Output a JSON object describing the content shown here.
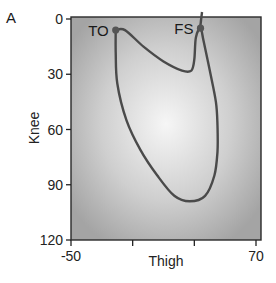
{
  "panel_label": "A",
  "chart_data": {
    "type": "line",
    "title": "",
    "xlabel": "Thigh",
    "ylabel": "Knee",
    "xlim": [
      -50,
      70
    ],
    "ylim": [
      120,
      0
    ],
    "y_inverted": true,
    "x_ticks": [
      -50,
      -10,
      30,
      70
    ],
    "x_tick_labels": [
      "-50",
      "",
      "",
      "70"
    ],
    "y_ticks": [
      0,
      30,
      60,
      90,
      120
    ],
    "y_tick_labels": [
      "0",
      "30",
      "60",
      "90",
      "120"
    ],
    "grid": false,
    "legend": null,
    "background": "radial gradient, light center fading to gray",
    "series": [
      {
        "name": "knee-thigh angle cycle",
        "closed": true,
        "points": [
          {
            "x": -21,
            "y": 6
          },
          {
            "x": -15,
            "y": 6
          },
          {
            "x": -3,
            "y": 15
          },
          {
            "x": 10,
            "y": 23
          },
          {
            "x": 22,
            "y": 28
          },
          {
            "x": 28,
            "y": 28
          },
          {
            "x": 30,
            "y": 22
          },
          {
            "x": 31,
            "y": 10
          },
          {
            "x": 34,
            "y": 5
          },
          {
            "x": 36,
            "y": 12
          },
          {
            "x": 40,
            "y": 28
          },
          {
            "x": 44,
            "y": 45
          },
          {
            "x": 45,
            "y": 58
          },
          {
            "x": 45,
            "y": 72
          },
          {
            "x": 43,
            "y": 85
          },
          {
            "x": 37,
            "y": 96
          },
          {
            "x": 27,
            "y": 99
          },
          {
            "x": 17,
            "y": 96
          },
          {
            "x": 6,
            "y": 85
          },
          {
            "x": -5,
            "y": 71
          },
          {
            "x": -14,
            "y": 55
          },
          {
            "x": -20,
            "y": 35
          },
          {
            "x": -21,
            "y": 18
          },
          {
            "x": -21,
            "y": 6
          }
        ]
      }
    ],
    "annotations": [
      {
        "text": "TO",
        "x": -21,
        "y": 6,
        "marker": true
      },
      {
        "text": "FS",
        "x": 34,
        "y": 5,
        "marker": true
      }
    ]
  },
  "colors": {
    "curve": "#4a4a4a",
    "marker": "#555555",
    "axis": "#222222",
    "bg_center": "#f4f4f4",
    "bg_edge": "#a9a9a9"
  }
}
